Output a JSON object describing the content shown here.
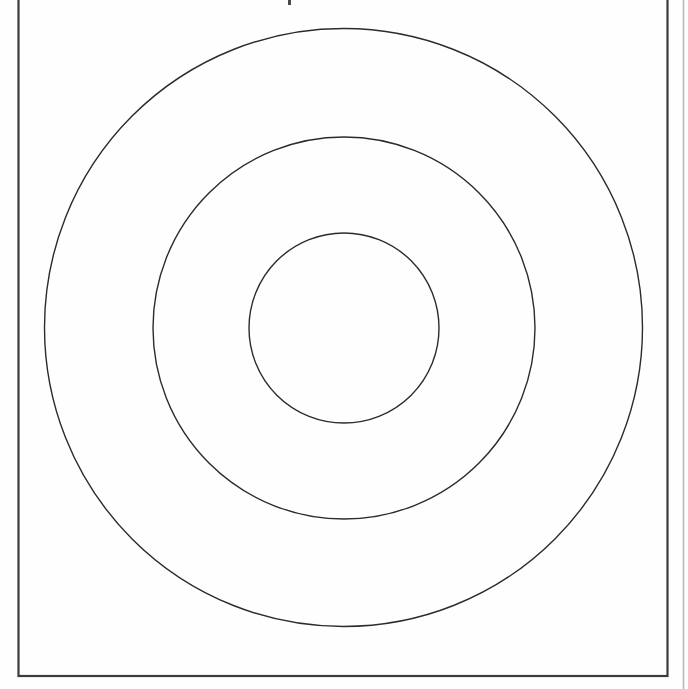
{
  "document": {
    "kind": "scanned-page",
    "page_background_color": "#fefefe",
    "canvas": {
      "width": 688,
      "height": 689
    }
  },
  "page_frame": {
    "name": "page-border-rectangle",
    "x": 18.5,
    "y": -8,
    "width": 649,
    "height": 684,
    "stroke_color": "#3b3b3b",
    "stroke_width": 2.2,
    "fill": "none"
  },
  "adjacent_page_edge": {
    "name": "adjacent-page-edge-line",
    "x": 683.5,
    "y_top": 0,
    "y_bottom": 689,
    "stroke_color": "#b9b9b9",
    "stroke_width": 1.6
  },
  "top_edge_artifact": {
    "name": "scan-speck",
    "x": 288,
    "y": 0,
    "width": 3,
    "height": 5,
    "color": "#4a4a4a"
  },
  "chart_data": {
    "type": "diagram",
    "subtype": "concentric-circles",
    "title": "",
    "xlabel": "",
    "ylabel": "",
    "grid": false,
    "legend": null,
    "units": "pixels",
    "center": {
      "x": 343.5,
      "y": 327.5
    },
    "ring_count": 3,
    "rings": [
      {
        "label": "outer-circle",
        "cx": 343.5,
        "cy": 327.5,
        "r": 299,
        "stroke_color": "#2b2b2b",
        "stroke_width": 1.4,
        "fill": "none",
        "bbox": {
          "left": 44.5,
          "right": 642.5,
          "top": 28.5,
          "bottom": 626.5
        }
      },
      {
        "label": "middle-circle",
        "cx": 344,
        "cy": 328,
        "r": 191,
        "stroke_color": "#2b2b2b",
        "stroke_width": 1.4,
        "fill": "none",
        "bbox": {
          "left": 153,
          "right": 535,
          "top": 137,
          "bottom": 519
        }
      },
      {
        "label": "inner-circle",
        "cx": 344,
        "cy": 328,
        "r": 95,
        "stroke_color": "#2b2b2b",
        "stroke_width": 1.4,
        "fill": "none",
        "bbox": {
          "left": 249,
          "right": 439,
          "top": 233,
          "bottom": 423
        }
      }
    ],
    "annotations": []
  }
}
